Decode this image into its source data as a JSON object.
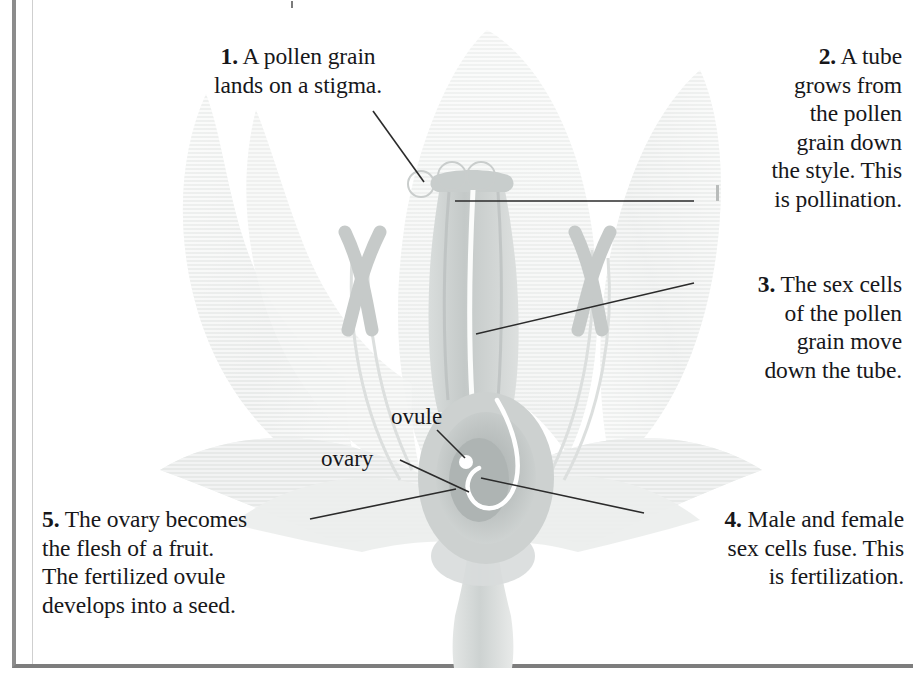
{
  "diagram": {
    "style": "grayscale botanical cutaway illustration",
    "background_color": "#ffffff",
    "text_color": "#17171a",
    "leader_line_color": "#2b2b2b",
    "frame_color": "#8c8c8c"
  },
  "captions": {
    "step1": "1. A pollen grain\nlands on a stigma.",
    "step1_number": "1.",
    "step1_body": " A pollen grain\nlands on a stigma.",
    "step2": "2. A tube\ngrows from\nthe pollen\ngrain down\nthe style. This\nis pollination.",
    "step2_number": "2.",
    "step2_body": " A tube\ngrows from\nthe pollen\ngrain down\nthe style. This\nis pollination.",
    "step3": "3. The sex cells\nof the pollen\ngrain move\ndown the tube.",
    "step3_number": "3.",
    "step3_body": " The sex cells\nof the pollen\ngrain move\ndown the tube.",
    "step4": "4. Male and female\nsex cells fuse. This\nis fertilization.",
    "step4_number": "4.",
    "step4_body": " Male and female\nsex cells fuse. This\nis fertilization.",
    "step5": "5. The ovary becomes\nthe flesh of a fruit.\nThe fertilized ovule\ndevelops into a seed.",
    "step5_number": "5.",
    "step5_body": " The ovary becomes\nthe flesh of a fruit.\nThe fertilized ovule\ndevelops into a seed."
  },
  "part_labels": {
    "ovule": "ovule",
    "ovary": "ovary"
  },
  "parts": [
    {
      "name": "petal-outer-left",
      "fill": "#eef0ef"
    },
    {
      "name": "petal-outer-right",
      "fill": "#eef0ef"
    },
    {
      "name": "petal-back-center",
      "fill": "#f4f5f4"
    },
    {
      "name": "sepal-lower-left",
      "fill": "#e6e8e7"
    },
    {
      "name": "sepal-lower-right",
      "fill": "#e6e8e7"
    },
    {
      "name": "stigma",
      "fill": "#cfd2d1"
    },
    {
      "name": "style",
      "fill": "#cfd2d1"
    },
    {
      "name": "ovary",
      "fill": "#b9bebd"
    },
    {
      "name": "ovule",
      "fill": "#ffffff"
    },
    {
      "name": "anther-left",
      "fill": "#c6cac9"
    },
    {
      "name": "anther-right",
      "fill": "#c6cac9"
    },
    {
      "name": "filament",
      "fill": "#dfe2e1"
    },
    {
      "name": "pollen-tube",
      "fill": "#ffffff"
    },
    {
      "name": "stem",
      "fill": "#d6dad9"
    }
  ],
  "pollen_grains": [
    {
      "id": "pollen-grain-1",
      "cx": 421,
      "cy": 184,
      "r": 13
    },
    {
      "id": "pollen-grain-2",
      "cx": 452,
      "cy": 176,
      "r": 14
    },
    {
      "id": "pollen-grain-3",
      "cx": 481,
      "cy": 176,
      "r": 14
    }
  ],
  "leader_lines": [
    {
      "name": "leader-step1",
      "from": "caption 1",
      "to": "pollen grain on stigma"
    },
    {
      "name": "leader-step2",
      "from": "caption 2",
      "to": "top of style"
    },
    {
      "name": "leader-step3",
      "from": "caption 3",
      "to": "mid style / pollen tube"
    },
    {
      "name": "leader-step4",
      "from": "caption 4",
      "to": "ovule centre"
    },
    {
      "name": "leader-step5",
      "from": "caption 5",
      "to": "ovary wall"
    },
    {
      "name": "leader-ovule",
      "from": "ovule label",
      "to": "ovule dot"
    },
    {
      "name": "leader-ovary",
      "from": "ovary label",
      "to": "ovary body"
    }
  ]
}
